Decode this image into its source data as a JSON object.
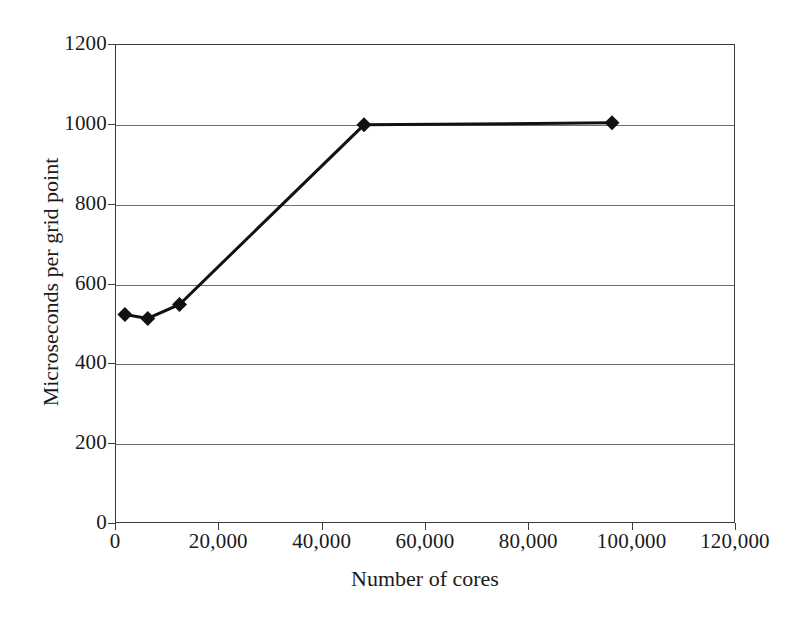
{
  "chart_data": {
    "type": "line",
    "title": "",
    "xlabel": "Number of cores",
    "ylabel": "Microseconds per grid point",
    "xlim": [
      0,
      120000
    ],
    "ylim": [
      0,
      1200
    ],
    "grid": "horizontal",
    "legend": "none",
    "marker": "filled-diamond",
    "line_color": "#111111",
    "grid_color": "#6e6e6e",
    "axis_color": "#3c3c3c",
    "background": "#ffffff",
    "x": [
      1728,
      6144,
      12288,
      48000,
      96000
    ],
    "values": [
      525,
      515,
      550,
      1000,
      1005
    ],
    "series": [
      {
        "name": "Microseconds per grid point",
        "points": [
          {
            "x": 1728,
            "y": 525
          },
          {
            "x": 6144,
            "y": 515
          },
          {
            "x": 12288,
            "y": 550
          },
          {
            "x": 48000,
            "y": 1000
          },
          {
            "x": 96000,
            "y": 1005
          }
        ]
      }
    ],
    "xticks": [
      0,
      20000,
      40000,
      60000,
      80000,
      100000,
      120000
    ],
    "xtick_labels": [
      "0",
      "20,000",
      "40,000",
      "60,000",
      "80,000",
      "100,000",
      "120,000"
    ],
    "yticks": [
      0,
      200,
      400,
      600,
      800,
      1000,
      1200
    ],
    "ytick_labels": [
      "0",
      "200",
      "400",
      "600",
      "800",
      "1000",
      "1200"
    ]
  }
}
